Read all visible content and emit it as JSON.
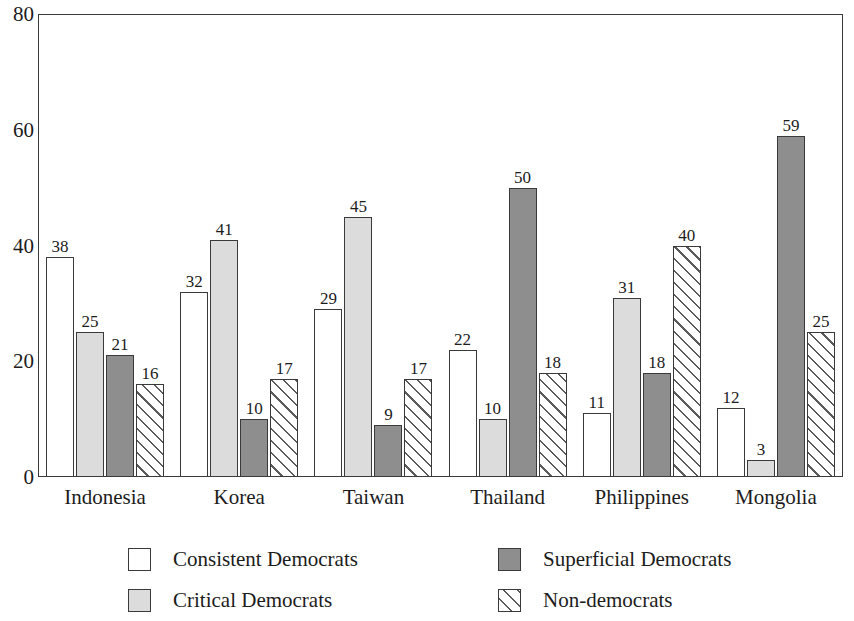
{
  "chart_data": {
    "type": "bar",
    "title": "",
    "subtitle": "",
    "xlabel": "",
    "ylabel": "",
    "ylim": [
      0,
      80
    ],
    "yticks": [
      0,
      20,
      40,
      60,
      80
    ],
    "ytick_labels": [
      "0",
      "20",
      "40",
      "60",
      "80"
    ],
    "grid": false,
    "legend_position": "bottom",
    "data_labels": true,
    "categories": [
      "Indonesia",
      "Korea",
      "Taiwan",
      "Thailand",
      "Philippines",
      "Mongolia"
    ],
    "series": [
      {
        "name": "Consistent Democrats",
        "fill": "white",
        "color": "#ffffff",
        "values": [
          38,
          32,
          29,
          22,
          11,
          12
        ]
      },
      {
        "name": "Critical Democrats",
        "fill": "light",
        "color": "#dcdcdc",
        "values": [
          25,
          41,
          45,
          10,
          31,
          3
        ]
      },
      {
        "name": "Superficial Democrats",
        "fill": "dark",
        "color": "#8e8e8e",
        "values": [
          21,
          10,
          9,
          50,
          18,
          59
        ]
      },
      {
        "name": "Non-democrats",
        "fill": "hatch",
        "color": "#ffffff",
        "values": [
          16,
          17,
          17,
          18,
          40,
          25
        ]
      }
    ]
  },
  "legend": {
    "items": [
      {
        "label": "Consistent Democrats",
        "swatch": "white"
      },
      {
        "label": "Superficial Democrats",
        "swatch": "dark"
      },
      {
        "label": "Critical Democrats",
        "swatch": "light"
      },
      {
        "label": "Non-democrats",
        "swatch": "hatch"
      }
    ]
  }
}
